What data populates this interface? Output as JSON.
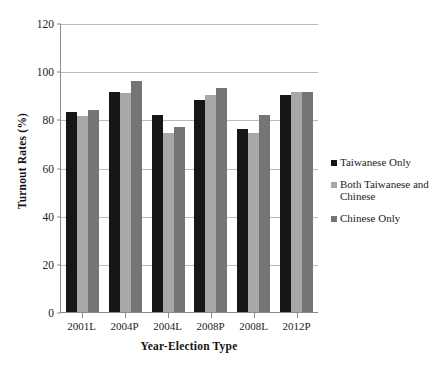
{
  "chart_data": {
    "type": "bar",
    "title": "",
    "xlabel": "Year-Election Type",
    "ylabel": "Turnout Rates (%)",
    "categories": [
      "2001L",
      "2004P",
      "2004L",
      "2008P",
      "2008L",
      "2012P"
    ],
    "series": [
      {
        "name": "Taiwanese Only",
        "color": "#161616",
        "values": [
          83,
          91.5,
          82,
          88,
          76,
          90
        ]
      },
      {
        "name": "Both Taiwanese and Chinese",
        "color": "#a8a8a8",
        "values": [
          81.5,
          91,
          74.5,
          90,
          74.5,
          91.5
        ]
      },
      {
        "name": "Chinese Only",
        "color": "#757575",
        "values": [
          84,
          96,
          77,
          93,
          82,
          91.5
        ]
      }
    ],
    "ylim": [
      0,
      120
    ],
    "yticks": [
      0,
      20,
      40,
      60,
      80,
      100,
      120
    ],
    "ytick_labels": [
      "0",
      "20",
      "40",
      "60",
      "80",
      "100",
      "120"
    ],
    "grid": true,
    "legend_position": "right"
  }
}
